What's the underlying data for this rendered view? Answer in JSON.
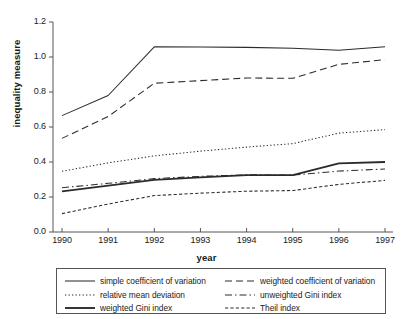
{
  "chart_data": {
    "type": "line",
    "title": "",
    "xlabel": "year",
    "ylabel": "inequality measure",
    "x": [
      1990,
      1991,
      1992,
      1993,
      1994,
      1995,
      1996,
      1997
    ],
    "xtick_labels": [
      "1990",
      "1991",
      "1992",
      "1993",
      "1994",
      "1995",
      "1996",
      "1997"
    ],
    "ytick_labels": [
      "0.0",
      "0.2",
      "0.4",
      "0.6",
      "0.8",
      "1.0",
      "1.2"
    ],
    "ytick_values": [
      0.0,
      0.2,
      0.4,
      0.6,
      0.8,
      1.0,
      1.2
    ],
    "xlim": [
      1990,
      1997
    ],
    "ylim": [
      0.0,
      1.2
    ],
    "grid": false,
    "legend_position": "below-axes",
    "series": [
      {
        "name": "simple coefficient of variation",
        "style": "solid",
        "width": "thin",
        "values": [
          0.665,
          0.78,
          1.058,
          1.057,
          1.055,
          1.05,
          1.038,
          1.058
        ]
      },
      {
        "name": "weighted coefficient of variation",
        "style": "dashed",
        "width": "thin",
        "values": [
          0.535,
          0.66,
          0.85,
          0.865,
          0.88,
          0.878,
          0.958,
          0.985
        ]
      },
      {
        "name": "relative mean deviation",
        "style": "dotted",
        "width": "thin",
        "values": [
          0.347,
          0.395,
          0.435,
          0.462,
          0.485,
          0.505,
          0.565,
          0.585
        ]
      },
      {
        "name": "unweighted Gini index",
        "style": "dashdot",
        "width": "thin",
        "values": [
          0.253,
          0.278,
          0.305,
          0.318,
          0.327,
          0.325,
          0.348,
          0.36
        ]
      },
      {
        "name": "weighted Gini index",
        "style": "solid",
        "width": "thick",
        "values": [
          0.232,
          0.265,
          0.298,
          0.312,
          0.325,
          0.325,
          0.392,
          0.4
        ]
      },
      {
        "name": "Theil index",
        "style": "shortdash",
        "width": "thin",
        "values": [
          0.105,
          0.16,
          0.208,
          0.222,
          0.233,
          0.237,
          0.272,
          0.295
        ]
      }
    ]
  },
  "legend": {
    "items": [
      {
        "label": "simple coefficient of variation"
      },
      {
        "label": "weighted coefficient of variation"
      },
      {
        "label": "relative mean deviation"
      },
      {
        "label": "unweighted Gini index"
      },
      {
        "label": "weighted Gini index"
      },
      {
        "label": "Theil index"
      }
    ]
  },
  "colors": {
    "line": "#2b2b2b",
    "axis": "#555555",
    "background": "#ffffff"
  }
}
